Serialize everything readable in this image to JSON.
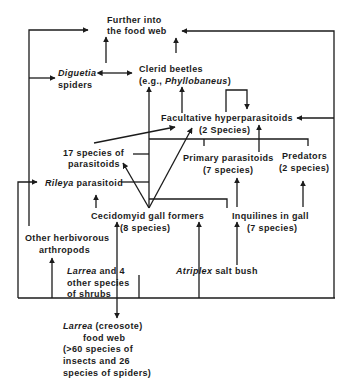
{
  "diagram": {
    "nodes": {
      "further": {
        "line1": "Further into",
        "line2": "the food web"
      },
      "diguetia": {
        "genus": "Diguetia",
        "line2": "spiders"
      },
      "clerid": {
        "line1": "Clerid beetles",
        "line2_prefix": "(e.g., ",
        "genus": "Phyllobaneus",
        "line2_suffix": ")"
      },
      "facultative": {
        "line1": "Facultative hyperparasitoids",
        "line2": "(2 Species)"
      },
      "parasitoids17": {
        "line1": "17 species of",
        "line2": "parasitoids"
      },
      "primary": {
        "line1": "Primary parasitoids",
        "line2": "(7 species)"
      },
      "predators": {
        "line1": "Predators",
        "line2": "(2 species)"
      },
      "rileya": {
        "genus": "Rileya",
        "suffix": " parasitoid"
      },
      "cecidomyid": {
        "line1": "Cecidomyid gall formers",
        "line2": "(8 species)"
      },
      "inquilines": {
        "line1": "Inquilines in gall",
        "line2": "(7 species)"
      },
      "other_herbivores": {
        "line1": "Other herbivorous",
        "line2": "arthropods"
      },
      "larrea_shrubs": {
        "genus": "Larrea",
        "line1_suffix": " and 4",
        "line2": "other species",
        "line3": "of shrubs"
      },
      "atriplex": {
        "genus": "Atriplex",
        "suffix": " salt bush"
      },
      "larrea_web": {
        "genus": "Larrea",
        "line1_suffix": " (creosote)",
        "line2": "food web",
        "line3": "(>60 species of",
        "line4": "insects and 26",
        "line5": "species of spiders)"
      }
    },
    "edges": [
      {
        "from": "other_herbivores",
        "to": "further"
      },
      {
        "from": "other_herbivores",
        "to": "diguetia"
      },
      {
        "from": "diguetia",
        "to": "further"
      },
      {
        "from": "diguetia",
        "to": "clerid",
        "bidirectional": true
      },
      {
        "from": "clerid",
        "to": "further"
      },
      {
        "from": "facultative",
        "to": "clerid"
      },
      {
        "from": "facultative",
        "to": "facultative"
      },
      {
        "from": "cecidomyid",
        "to": "clerid"
      },
      {
        "from": "cecidomyid",
        "to": "parasitoids17"
      },
      {
        "from": "cecidomyid",
        "to": "facultative"
      },
      {
        "from": "parasitoids17",
        "to": "facultative"
      },
      {
        "from": "primary",
        "to": "facultative"
      },
      {
        "from": "cecidomyid",
        "to": "rileya"
      },
      {
        "from": "inquilines",
        "to": "primary"
      },
      {
        "from": "inquilines",
        "to": "predators"
      },
      {
        "from": "larrea_shrubs",
        "to": "cecidomyid"
      },
      {
        "from": "larrea_shrubs",
        "to": "other_herbivores"
      },
      {
        "from": "larrea_shrubs",
        "to": "larrea_web"
      },
      {
        "from": "atriplex",
        "to": "cecidomyid"
      },
      {
        "from": "atriplex",
        "to": "inquilines"
      },
      {
        "from": "shrub_base",
        "to": "rileya"
      },
      {
        "from": "shrub_base",
        "to": "facultative"
      },
      {
        "from": "shrub_base",
        "to": "further"
      }
    ]
  }
}
